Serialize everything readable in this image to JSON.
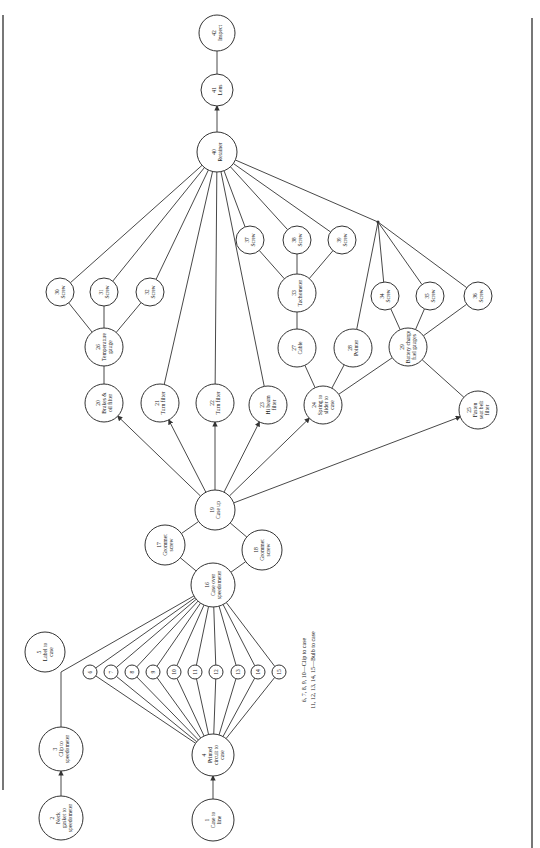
{
  "diagram": {
    "type": "precedence-diagram",
    "orientation": "rotated-90-ccw",
    "nodes": [
      {
        "id": "1",
        "num": "1",
        "lines": [
          "Case to",
          "line"
        ],
        "x": 213,
        "y": 820,
        "r": 21
      },
      {
        "id": "2",
        "num": "2",
        "lines": [
          "Neck",
          "gasket to",
          "speedometer"
        ],
        "x": 61,
        "y": 818,
        "r": 22
      },
      {
        "id": "3",
        "num": "3",
        "lines": [
          "Clip to",
          "speedometer"
        ],
        "x": 61,
        "y": 749,
        "r": 22
      },
      {
        "id": "4",
        "num": "4",
        "lines": [
          "Printed",
          "circuit to",
          "case"
        ],
        "x": 213,
        "y": 755,
        "r": 21
      },
      {
        "id": "5",
        "num": "5",
        "lines": [
          "Label to",
          "case"
        ],
        "x": 45,
        "y": 652,
        "r": 20
      },
      {
        "id": "6",
        "num": "6",
        "lines": [],
        "x": 90,
        "y": 672,
        "r": 7
      },
      {
        "id": "7",
        "num": "7",
        "lines": [],
        "x": 111,
        "y": 672,
        "r": 7
      },
      {
        "id": "8",
        "num": "8",
        "lines": [],
        "x": 132,
        "y": 672,
        "r": 7
      },
      {
        "id": "9",
        "num": "9",
        "lines": [],
        "x": 153,
        "y": 672,
        "r": 7
      },
      {
        "id": "10",
        "num": "10",
        "lines": [],
        "x": 174,
        "y": 672,
        "r": 7
      },
      {
        "id": "11",
        "num": "11",
        "lines": [],
        "x": 195,
        "y": 672,
        "r": 7
      },
      {
        "id": "12",
        "num": "12",
        "lines": [],
        "x": 216,
        "y": 672,
        "r": 7
      },
      {
        "id": "13",
        "num": "13",
        "lines": [],
        "x": 238,
        "y": 672,
        "r": 7
      },
      {
        "id": "14",
        "num": "14",
        "lines": [],
        "x": 258,
        "y": 672,
        "r": 7
      },
      {
        "id": "15",
        "num": "15",
        "lines": [],
        "x": 279,
        "y": 672,
        "r": 7
      },
      {
        "id": "16",
        "num": "16",
        "lines": [
          "Case over",
          "speedometer"
        ],
        "x": 213,
        "y": 585,
        "r": 22
      },
      {
        "id": "17",
        "num": "17",
        "lines": [
          "Grommet",
          "screw"
        ],
        "x": 165,
        "y": 545,
        "r": 20
      },
      {
        "id": "18",
        "num": "18",
        "lines": [
          "Grommet",
          "screw"
        ],
        "x": 262,
        "y": 550,
        "r": 20
      },
      {
        "id": "19",
        "num": "19",
        "lines": [
          "Case up"
        ],
        "x": 215,
        "y": 510,
        "r": 20
      },
      {
        "id": "20",
        "num": "20",
        "lines": [
          "Brakes &",
          "oil filter"
        ],
        "x": 104,
        "y": 403,
        "r": 19
      },
      {
        "id": "21",
        "num": "21",
        "lines": [
          "Turn filter"
        ],
        "x": 160,
        "y": 403,
        "r": 19
      },
      {
        "id": "22",
        "num": "22",
        "lines": [
          "Turn filter"
        ],
        "x": 215,
        "y": 403,
        "r": 19
      },
      {
        "id": "23",
        "num": "23",
        "lines": [
          "Hi beam",
          "filter"
        ],
        "x": 268,
        "y": 405,
        "r": 19
      },
      {
        "id": "24",
        "num": "24",
        "lines": [
          "Spring to",
          "slider to",
          "case"
        ],
        "x": 323,
        "y": 405,
        "r": 19
      },
      {
        "id": "25",
        "num": "25",
        "lines": [
          "Fasten",
          "seat belt",
          "filter"
        ],
        "x": 478,
        "y": 410,
        "r": 19
      },
      {
        "id": "26",
        "num": "26",
        "lines": [
          "Temperature",
          "gauge"
        ],
        "x": 104,
        "y": 347,
        "r": 19
      },
      {
        "id": "27",
        "num": "27",
        "lines": [
          "Cable"
        ],
        "x": 297,
        "y": 348,
        "r": 19
      },
      {
        "id": "28",
        "num": "28",
        "lines": [
          "Pointer"
        ],
        "x": 353,
        "y": 348,
        "r": 19
      },
      {
        "id": "29",
        "num": "29",
        "lines": [
          "Battery charge",
          "fuel gauges"
        ],
        "x": 408,
        "y": 347,
        "r": 19
      },
      {
        "id": "30",
        "num": "30",
        "lines": [
          "Screw"
        ],
        "x": 60,
        "y": 292,
        "r": 14
      },
      {
        "id": "31",
        "num": "31",
        "lines": [
          "Screw"
        ],
        "x": 104,
        "y": 292,
        "r": 14
      },
      {
        "id": "32",
        "num": "32",
        "lines": [
          "Screw"
        ],
        "x": 150,
        "y": 292,
        "r": 14
      },
      {
        "id": "33",
        "num": "33",
        "lines": [
          "Tachometer"
        ],
        "x": 297,
        "y": 293,
        "r": 19
      },
      {
        "id": "34",
        "num": "34",
        "lines": [
          "Screw"
        ],
        "x": 385,
        "y": 296,
        "r": 14
      },
      {
        "id": "35",
        "num": "35",
        "lines": [
          "Screw"
        ],
        "x": 430,
        "y": 296,
        "r": 14
      },
      {
        "id": "36",
        "num": "36",
        "lines": [
          "Screw"
        ],
        "x": 478,
        "y": 296,
        "r": 14
      },
      {
        "id": "37",
        "num": "37",
        "lines": [
          "Screw"
        ],
        "x": 250,
        "y": 240,
        "r": 14
      },
      {
        "id": "38",
        "num": "38",
        "lines": [
          "Screw"
        ],
        "x": 297,
        "y": 240,
        "r": 14
      },
      {
        "id": "39",
        "num": "39",
        "lines": [
          "Screw"
        ],
        "x": 342,
        "y": 240,
        "r": 14
      },
      {
        "id": "40",
        "num": "40",
        "lines": [
          "Retainer"
        ],
        "x": 217,
        "y": 152,
        "r": 20
      },
      {
        "id": "41",
        "num": "41",
        "lines": [
          "Lens"
        ],
        "x": 217,
        "y": 90,
        "r": 16
      },
      {
        "id": "42",
        "num": "42",
        "lines": [
          "Inspect"
        ],
        "x": 217,
        "y": 33,
        "r": 18
      }
    ],
    "junctions": [
      {
        "id": "J1",
        "x": 378,
        "y": 222
      }
    ],
    "edges": [
      {
        "from": "1",
        "to": "4",
        "arrow": true
      },
      {
        "from": "2",
        "to": "3",
        "arrow": true
      },
      {
        "from": "3",
        "to": "16",
        "arrow": false,
        "via": [
          [
            61,
            672
          ]
        ]
      },
      {
        "from": "4",
        "to": "6"
      },
      {
        "from": "4",
        "to": "7"
      },
      {
        "from": "4",
        "to": "8"
      },
      {
        "from": "4",
        "to": "9"
      },
      {
        "from": "4",
        "to": "10"
      },
      {
        "from": "4",
        "to": "11"
      },
      {
        "from": "4",
        "to": "12"
      },
      {
        "from": "4",
        "to": "13"
      },
      {
        "from": "4",
        "to": "14"
      },
      {
        "from": "4",
        "to": "15"
      },
      {
        "from": "6",
        "to": "16"
      },
      {
        "from": "7",
        "to": "16"
      },
      {
        "from": "8",
        "to": "16"
      },
      {
        "from": "9",
        "to": "16"
      },
      {
        "from": "10",
        "to": "16"
      },
      {
        "from": "11",
        "to": "16"
      },
      {
        "from": "12",
        "to": "16"
      },
      {
        "from": "13",
        "to": "16"
      },
      {
        "from": "14",
        "to": "16"
      },
      {
        "from": "15",
        "to": "16"
      },
      {
        "from": "16",
        "to": "17"
      },
      {
        "from": "16",
        "to": "18"
      },
      {
        "from": "17",
        "to": "19"
      },
      {
        "from": "18",
        "to": "19"
      },
      {
        "from": "19",
        "to": "20",
        "arrow": true
      },
      {
        "from": "19",
        "to": "21",
        "arrow": true
      },
      {
        "from": "19",
        "to": "22",
        "arrow": true
      },
      {
        "from": "19",
        "to": "23",
        "arrow": true
      },
      {
        "from": "19",
        "to": "24",
        "arrow": true
      },
      {
        "from": "19",
        "to": "25",
        "arrow": true
      },
      {
        "from": "20",
        "to": "26"
      },
      {
        "from": "26",
        "to": "30"
      },
      {
        "from": "26",
        "to": "31"
      },
      {
        "from": "26",
        "to": "32"
      },
      {
        "from": "24",
        "to": "27"
      },
      {
        "from": "24",
        "to": "28"
      },
      {
        "from": "24",
        "to": "29"
      },
      {
        "from": "27",
        "to": "33"
      },
      {
        "from": "33",
        "to": "37"
      },
      {
        "from": "33",
        "to": "38"
      },
      {
        "from": "33",
        "to": "39"
      },
      {
        "from": "29",
        "to": "34"
      },
      {
        "from": "29",
        "to": "35"
      },
      {
        "from": "29",
        "to": "36"
      },
      {
        "from": "29",
        "to": "25"
      },
      {
        "from": "30",
        "to": "40"
      },
      {
        "from": "31",
        "to": "40"
      },
      {
        "from": "32",
        "to": "40"
      },
      {
        "from": "21",
        "to": "40"
      },
      {
        "from": "22",
        "to": "40"
      },
      {
        "from": "23",
        "to": "40"
      },
      {
        "from": "37",
        "to": "40"
      },
      {
        "from": "38",
        "to": "40"
      },
      {
        "from": "39",
        "to": "40"
      },
      {
        "from": "28",
        "to": "J1"
      },
      {
        "from": "34",
        "to": "J1"
      },
      {
        "from": "35",
        "to": "J1"
      },
      {
        "from": "36",
        "to": "J1"
      },
      {
        "from": "J1",
        "to": "40"
      },
      {
        "from": "40",
        "to": "41",
        "arrow": true
      },
      {
        "from": "41",
        "to": "42"
      }
    ],
    "footnote": {
      "line1": "6, 7, 8, 9, 10—Clip to case",
      "line2": "11, 12, 13, 14, 15—Bulb to case",
      "x": 310,
      "y": 670
    },
    "colors": {
      "line": "#333333",
      "node_fill": "#ffffff",
      "text": "#222222",
      "border": "#555555"
    }
  }
}
